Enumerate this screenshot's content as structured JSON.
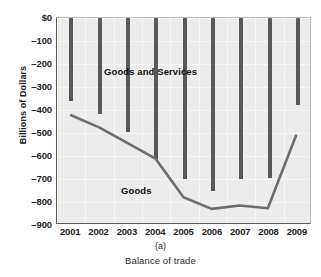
{
  "figure": {
    "panel_id": "(a)",
    "caption": "Balance of trade",
    "top_artifact": "",
    "bar_color": "#585858",
    "line_color": "#6e6e6e",
    "plot_bg": "#ececec"
  },
  "axes": {
    "ylabel": "Billions of Dollars",
    "yticks": [
      "$0",
      "–100",
      "–200",
      "–300",
      "–400",
      "–500",
      "–600",
      "–700",
      "–800",
      "–900"
    ],
    "ytick_values": [
      0,
      -100,
      -200,
      -300,
      -400,
      -500,
      -600,
      -700,
      -800,
      -900
    ],
    "xticks": [
      "2001",
      "2002",
      "2003",
      "2004",
      "2005",
      "2006",
      "2007",
      "2008",
      "2009"
    ]
  },
  "series_labels": {
    "bars": "Goods and Services",
    "line": "Goods"
  },
  "chart_data": {
    "type": "bar",
    "title": "Balance of trade",
    "xlabel": "",
    "ylabel": "Billions of Dollars",
    "ylim": [
      -900,
      0
    ],
    "grid": true,
    "legend": "inline-annotations",
    "categories": [
      "2001",
      "2002",
      "2003",
      "2004",
      "2005",
      "2006",
      "2007",
      "2008",
      "2009"
    ],
    "series": [
      {
        "name": "Goods and Services",
        "type": "bar",
        "values": [
          -361,
          -418,
          -496,
          -613,
          -700,
          -752,
          -700,
          -695,
          -378
        ]
      },
      {
        "name": "Goods",
        "type": "line",
        "values": [
          -427,
          -480,
          -548,
          -617,
          -787,
          -838,
          -823,
          -835,
          -517
        ]
      }
    ]
  }
}
